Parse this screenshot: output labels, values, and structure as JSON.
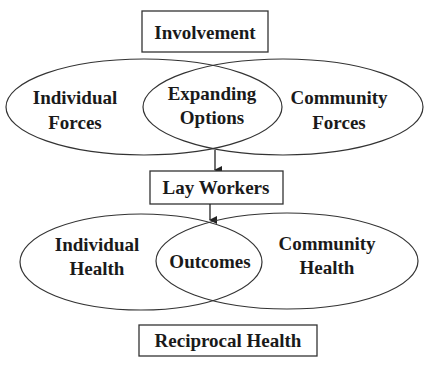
{
  "diagram": {
    "top_box": {
      "label": "Involvement"
    },
    "upper_venn": {
      "left": {
        "line1": "Individual",
        "line2": "Forces"
      },
      "center": {
        "line1": "Expanding",
        "line2": "Options"
      },
      "right": {
        "line1": "Community",
        "line2": "Forces"
      }
    },
    "middle_box": {
      "label": "Lay Workers"
    },
    "lower_venn": {
      "left": {
        "line1": "Individual",
        "line2": "Health"
      },
      "center": {
        "line1": "Outcomes"
      },
      "right": {
        "line1": "Community",
        "line2": "Health"
      }
    },
    "bottom_box": {
      "label": "Reciprocal Health"
    },
    "colors": {
      "stroke": "#333333",
      "text": "#1a1a1a",
      "background": "#ffffff"
    }
  }
}
